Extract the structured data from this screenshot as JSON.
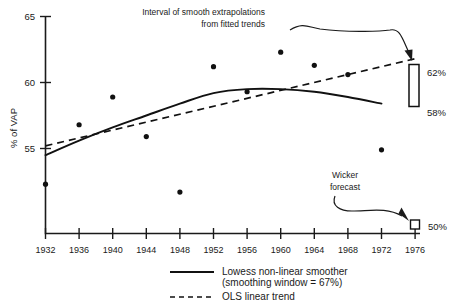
{
  "chart_data": {
    "type": "scatter",
    "title": "",
    "xlabel": "",
    "ylabel": "% of VAP",
    "xlim": [
      1930,
      1978
    ],
    "ylim": [
      50.5,
      65
    ],
    "grid": false,
    "x_ticks": [
      1932,
      1936,
      1940,
      1944,
      1948,
      1952,
      1956,
      1960,
      1964,
      1968,
      1972,
      1976
    ],
    "y_ticks": [
      55,
      60,
      65
    ],
    "x": [
      1932,
      1936,
      1940,
      1944,
      1948,
      1952,
      1956,
      1960,
      1964,
      1968,
      1972
    ],
    "values": [
      52.3,
      56.8,
      58.9,
      55.9,
      51.7,
      61.2,
      59.3,
      62.3,
      61.3,
      60.6,
      54.9
    ],
    "series": [
      {
        "name": "Observed turnout",
        "type": "scatter",
        "x": [
          1932,
          1936,
          1940,
          1944,
          1948,
          1952,
          1956,
          1960,
          1964,
          1968,
          1972
        ],
        "values": [
          52.3,
          56.8,
          58.9,
          55.9,
          51.7,
          61.2,
          59.3,
          62.3,
          61.3,
          60.6,
          54.9
        ]
      },
      {
        "name": "Lowess non-linear smoother",
        "type": "line",
        "x": [
          1932,
          1936,
          1940,
          1944,
          1948,
          1952,
          1956,
          1960,
          1964,
          1968,
          1972
        ],
        "values": [
          54.5,
          55.6,
          56.6,
          57.5,
          58.4,
          59.2,
          59.5,
          59.5,
          59.3,
          58.9,
          58.4
        ]
      },
      {
        "name": "OLS linear trend",
        "type": "line",
        "x": [
          1932,
          1976
        ],
        "values": [
          55.2,
          61.8
        ]
      }
    ],
    "legend_position": "bottom",
    "annotations": [
      {
        "name": "extrapolation-interval",
        "text": "Interval of smooth extrapolations from fitted trends",
        "target_x": 1976,
        "target_range": [
          58,
          62
        ]
      },
      {
        "name": "wicker-forecast",
        "text": "Wicker forecast",
        "target_x": 1976,
        "target_y": 50
      }
    ]
  },
  "axes": {
    "y_label": "% of VAP",
    "y_ticks": [
      {
        "label": "65",
        "value": 65
      },
      {
        "label": "60",
        "value": 60
      },
      {
        "label": "55",
        "value": 55
      }
    ],
    "x_ticks": [
      {
        "label": "1932"
      },
      {
        "label": "1936"
      },
      {
        "label": "1940"
      },
      {
        "label": "1944"
      },
      {
        "label": "1948"
      },
      {
        "label": "1952"
      },
      {
        "label": "1956"
      },
      {
        "label": "1960"
      },
      {
        "label": "1964"
      },
      {
        "label": "1968"
      },
      {
        "label": "1972"
      },
      {
        "label": "1976"
      }
    ]
  },
  "annotations": {
    "interval_line1": "Interval of smooth extrapolations",
    "interval_line2": "from fitted trends",
    "interval_upper_label": "62%",
    "interval_lower_label": "58%",
    "forecast_line1": "Wicker",
    "forecast_line2": "forecast",
    "forecast_label": "50%"
  },
  "legend": {
    "items": [
      {
        "style": "solid",
        "line1": "Lowess non-linear smoother",
        "line2": "(smoothing window = 67%)"
      },
      {
        "style": "dashed",
        "line1": "OLS linear trend",
        "line2": ""
      }
    ]
  },
  "colors": {
    "ink": "#111111",
    "background": "#ffffff"
  }
}
